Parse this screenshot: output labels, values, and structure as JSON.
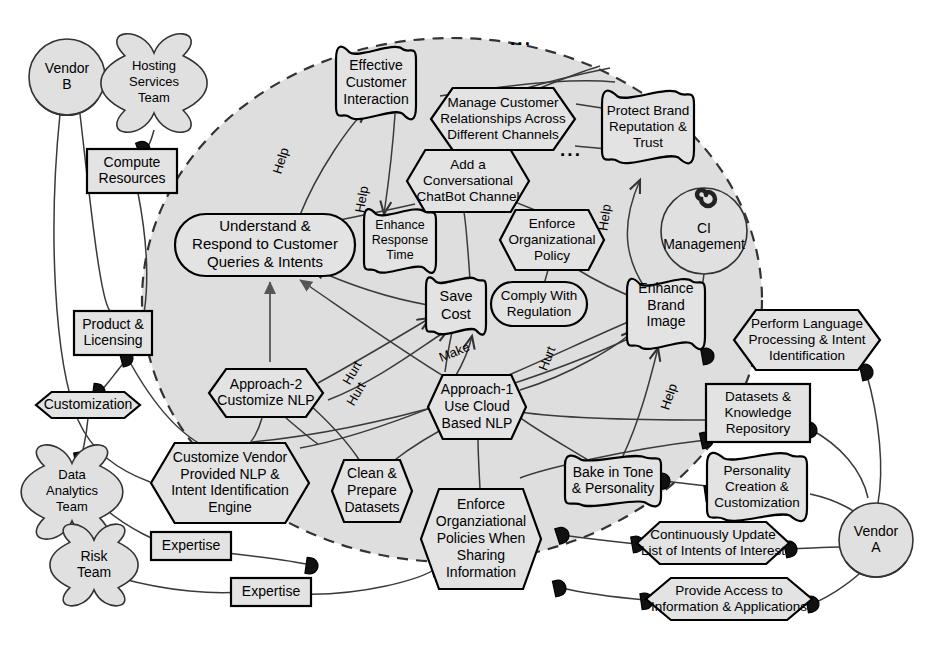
{
  "diagram": {
    "boundary_label": "",
    "colors": {
      "boundary_fill": "#dedede",
      "node_fill": "#e3e3e3",
      "stroke": "#000000",
      "link": "#3a3a3a"
    },
    "ellipsis_marks": [
      "...",
      "..."
    ]
  },
  "actors": [
    {
      "id": "vendor_b",
      "label": "Vendor\nB",
      "lines": [
        "Vendor",
        "B"
      ],
      "shape": "role-circle",
      "cx": 67,
      "cy": 77,
      "r": 38
    },
    {
      "id": "hosting_services_team",
      "label": "Hosting Services Team",
      "lines": [
        "Hosting",
        "Services",
        "Team"
      ],
      "shape": "agent-cloud",
      "cx": 154,
      "cy": 83,
      "r": 47
    },
    {
      "id": "data_analytics_team",
      "label": "Data Analytics Team",
      "lines": [
        "Data",
        "Analytics",
        "Team"
      ],
      "shape": "agent-cloud",
      "cx": 72,
      "cy": 492,
      "r": 45
    },
    {
      "id": "risk_team",
      "label": "Risk Team",
      "lines": [
        "Risk",
        "Team"
      ],
      "shape": "agent-cloud",
      "cx": 94,
      "cy": 565,
      "r": 39
    },
    {
      "id": "ci_management",
      "label": "CI Management",
      "lines": [
        "CI",
        "Management"
      ],
      "shape": "actor-circle-spiral",
      "cx": 704,
      "cy": 231,
      "r": 43
    },
    {
      "id": "vendor_a",
      "label": "Vendor\nA",
      "lines": [
        "Vendor",
        "A"
      ],
      "shape": "role-circle",
      "cx": 876,
      "cy": 540,
      "r": 37
    }
  ],
  "nodes": [
    {
      "id": "effective_customer_interaction",
      "label": "Effective Customer Interaction",
      "lines": [
        "Effective",
        "Customer",
        "Interaction"
      ],
      "type": "softgoal",
      "x": 376,
      "y": 83,
      "w": 80,
      "h": 66,
      "fontsize": 14
    },
    {
      "id": "manage_customer_relationships",
      "label": "Manage Customer Relationships Across Different Channels",
      "lines": [
        "Manage Customer",
        "Relationships Across",
        "Different Channels"
      ],
      "type": "task-hexagon",
      "x": 503,
      "y": 119,
      "w": 144,
      "h": 62,
      "fontsize": 13.5
    },
    {
      "id": "protect_brand_reputation",
      "label": "Protect Brand Reputation & Trust",
      "lines": [
        "Protect Brand",
        "Reputation &",
        "Trust"
      ],
      "type": "softgoal",
      "x": 648,
      "y": 127,
      "w": 92,
      "h": 66,
      "fontsize": 13.5
    },
    {
      "id": "add_conversational_chatbot_channel",
      "label": "Add a Conversational ChatBot Channel",
      "lines": [
        "Add a",
        "Conversational",
        "ChatBot Channel"
      ],
      "type": "task-hexagon",
      "x": 468,
      "y": 181,
      "w": 122,
      "h": 62,
      "fontsize": 13.5
    },
    {
      "id": "understand_respond_customer",
      "label": "Understand & Respond to Customer Queries & Intents",
      "lines": [
        "Understand &",
        "Respond to Customer",
        "Queries & Intents"
      ],
      "type": "goal-rounded",
      "x": 265,
      "y": 245,
      "w": 180,
      "h": 62,
      "fontsize": 15
    },
    {
      "id": "enhance_response_time",
      "label": "Enhance Response Time",
      "lines": [
        "Enhance",
        "Response",
        "Time"
      ],
      "type": "softgoal",
      "x": 400,
      "y": 241,
      "w": 72,
      "h": 58,
      "fontsize": 12.5
    },
    {
      "id": "enforce_organizational_policy",
      "label": "Enforce Organizational Policy",
      "lines": [
        "Enforce",
        "Organizational",
        "Policy"
      ],
      "type": "task-hexagon",
      "x": 552,
      "y": 240,
      "w": 104,
      "h": 60,
      "fontsize": 13.5
    },
    {
      "id": "save_cost",
      "label": "Save Cost",
      "lines": [
        "Save",
        "Cost"
      ],
      "type": "softgoal",
      "x": 456,
      "y": 306,
      "w": 60,
      "h": 52,
      "fontsize": 14.5
    },
    {
      "id": "comply_with_regulation",
      "label": "Comply With Regulation",
      "lines": [
        "Comply With",
        "Regulation"
      ],
      "type": "goal-rounded",
      "x": 539,
      "y": 304,
      "w": 96,
      "h": 44,
      "fontsize": 13.5
    },
    {
      "id": "enhance_brand_image",
      "label": "Enhance Brand Image",
      "lines": [
        "Enhance",
        "Brand",
        "Image",
        ""
      ],
      "type": "softgoal",
      "x": 666,
      "y": 314,
      "w": 78,
      "h": 64,
      "fontsize": 14
    },
    {
      "id": "perform_language_processing",
      "label": "Perform Language Processing & Intent Identification",
      "lines": [
        "Perform Language",
        "Processing & Intent",
        "Identification"
      ],
      "type": "task-hexagon",
      "x": 807,
      "y": 340,
      "w": 146,
      "h": 60,
      "fontsize": 13.5
    },
    {
      "id": "approach_2_customize_nlp",
      "label": "Approach-2 Customize NLP",
      "lines": [
        "Approach-2",
        "Customize NLP"
      ],
      "type": "task-hexagon",
      "x": 266,
      "y": 393,
      "w": 114,
      "h": 48,
      "fontsize": 14
    },
    {
      "id": "approach_1_use_cloud_nlp",
      "label": "Approach-1 Use Cloud Based NLP",
      "lines": [
        "Approach-1",
        "Use Cloud",
        "Based NLP"
      ],
      "type": "task-hexagon",
      "x": 477,
      "y": 407,
      "w": 98,
      "h": 64,
      "fontsize": 14
    },
    {
      "id": "datasets_knowledge_repository",
      "label": "Datasets & Knowledge Repository",
      "lines": [
        "Datasets &",
        "Knowledge",
        "Repository"
      ],
      "type": "resource-rect",
      "x": 758,
      "y": 413,
      "w": 104,
      "h": 58,
      "fontsize": 13.5
    },
    {
      "id": "product_licensing",
      "label": "Product & Licensing",
      "lines": [
        "Product &",
        "Licensing"
      ],
      "type": "resource-rect",
      "x": 113,
      "y": 333,
      "w": 78,
      "h": 44,
      "fontsize": 14
    },
    {
      "id": "compute_resources",
      "label": "Compute Resources",
      "lines": [
        "Compute",
        "Resources"
      ],
      "type": "resource-rect",
      "x": 132,
      "y": 171,
      "w": 90,
      "h": 44,
      "fontsize": 14
    },
    {
      "id": "customization",
      "label": "Customization",
      "lines": [
        "Customization"
      ],
      "type": "task-hexagon",
      "x": 88,
      "y": 405,
      "w": 104,
      "h": 26,
      "fontsize": 14
    },
    {
      "id": "customize_vendor_provided_nlp",
      "label": "Customize Vendor Provided NLP & Intent Identification Engine",
      "lines": [
        "Customize Vendor",
        "Provided NLP &",
        "Intent Identification",
        "Engine"
      ],
      "type": "task-hexagon",
      "x": 230,
      "y": 483,
      "w": 158,
      "h": 80,
      "fontsize": 14
    },
    {
      "id": "clean_prepare_datasets",
      "label": "Clean & Prepare Datasets",
      "lines": [
        "Clean &",
        "Prepare",
        "Datasets"
      ],
      "type": "task-hexagon",
      "x": 372,
      "y": 491,
      "w": 80,
      "h": 62,
      "fontsize": 14
    },
    {
      "id": "enforce_org_policies_sharing",
      "label": "Enforce Organziational Policies When Sharing Information",
      "lines": [
        "Enforce",
        "Organziational",
        "Policies When",
        "Sharing",
        "Information"
      ],
      "type": "task-hexagon",
      "x": 481,
      "y": 539,
      "w": 120,
      "h": 100,
      "fontsize": 14
    },
    {
      "id": "bake_in_tone_personality",
      "label": "Bake in Tone & Personality",
      "lines": [
        "Bake in Tone",
        "& Personality"
      ],
      "type": "softgoal",
      "x": 613,
      "y": 481,
      "w": 96,
      "h": 46,
      "fontsize": 14
    },
    {
      "id": "personality_creation_customization",
      "label": "Personality Creation & Customization",
      "lines": [
        "Personality",
        "Creation &",
        "Customization"
      ],
      "type": "softgoal",
      "x": 757,
      "y": 487,
      "w": 100,
      "h": 62,
      "fontsize": 13.5
    },
    {
      "id": "continuously_update_intents",
      "label": "Continuously Update List of Intents of Interest",
      "lines": [
        "Continuously Update",
        "List of Intents of Interest"
      ],
      "type": "task-hexagon",
      "x": 713,
      "y": 543,
      "w": 152,
      "h": 42,
      "fontsize": 13.5
    },
    {
      "id": "provide_access_information",
      "label": "Provide Access to Information & Applications",
      "lines": [
        "Provide Access to",
        "Information & Applications"
      ],
      "type": "task-hexagon",
      "x": 729,
      "y": 599,
      "w": 166,
      "h": 42,
      "fontsize": 13.5
    },
    {
      "id": "expertise_1",
      "label": "Expertise",
      "lines": [
        "Expertise"
      ],
      "type": "resource-rect",
      "x": 191,
      "y": 546,
      "w": 80,
      "h": 28,
      "fontsize": 14
    },
    {
      "id": "expertise_2",
      "label": "Expertise",
      "lines": [
        "Expertise"
      ],
      "type": "resource-rect",
      "x": 271,
      "y": 592,
      "w": 80,
      "h": 28,
      "fontsize": 14
    }
  ],
  "contribution_labels": [
    {
      "id": "help_1",
      "text": "Help",
      "x": 285,
      "y": 162,
      "rot": -73
    },
    {
      "id": "help_2",
      "text": "Help",
      "x": 366,
      "y": 200,
      "rot": -80
    },
    {
      "id": "help_3",
      "text": "Help",
      "x": 609,
      "y": 218,
      "rot": -82
    },
    {
      "id": "help_4",
      "text": "Help",
      "x": 673,
      "y": 398,
      "rot": -72
    },
    {
      "id": "hurt_1",
      "text": "Hurt",
      "x": 356,
      "y": 375,
      "rot": -60
    },
    {
      "id": "hurt_2",
      "text": "Hurt",
      "x": 360,
      "y": 396,
      "rot": -60
    },
    {
      "id": "hurt_3",
      "text": "Hurt",
      "x": 551,
      "y": 360,
      "rot": -68
    },
    {
      "id": "make_1",
      "text": "Make",
      "x": 456,
      "y": 356,
      "rot": -22
    }
  ]
}
